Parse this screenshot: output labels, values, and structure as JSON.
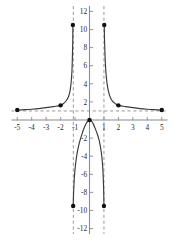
{
  "chart_data": {
    "type": "line",
    "title": "",
    "subtitle": "",
    "xlabel": "",
    "ylabel": "",
    "xlim": [
      -5.4,
      5.4
    ],
    "ylim": [
      -12.6,
      12.6
    ],
    "grid": false,
    "legend": "none",
    "x_ticks": [
      -5,
      -4,
      -3,
      -2,
      -1,
      1,
      2,
      3,
      4,
      5
    ],
    "x_tick_labels": [
      "-5",
      "-4",
      "-3",
      "-2",
      "-1",
      "1",
      "2",
      "3",
      "4",
      "5"
    ],
    "y_ticks": [
      12,
      10,
      8,
      6,
      4,
      2,
      -2,
      -4,
      -6,
      -8,
      -10,
      -12
    ],
    "y_tick_labels": [
      "12",
      "10",
      "8",
      "6",
      "4",
      "2",
      "-2",
      "-4",
      "-6",
      "-8",
      "-10",
      "-12"
    ],
    "asymptotes": {
      "horizontal": [
        1
      ],
      "vertical": [
        -1.12,
        1.0
      ]
    },
    "series": [
      {
        "name": "left-branch",
        "points": [
          [
            -5.0,
            1.1
          ],
          [
            -4.5,
            1.14
          ],
          [
            -4.0,
            1.19
          ],
          [
            -3.5,
            1.26
          ],
          [
            -3.0,
            1.36
          ],
          [
            -2.5,
            1.48
          ],
          [
            -2.0,
            1.62
          ],
          [
            -1.8,
            1.82
          ],
          [
            -1.6,
            2.15
          ],
          [
            -1.45,
            2.6
          ],
          [
            -1.35,
            3.2
          ],
          [
            -1.28,
            4.0
          ],
          [
            -1.23,
            5.0
          ],
          [
            -1.2,
            6.0
          ],
          [
            -1.18,
            7.2
          ],
          [
            -1.16,
            8.6
          ],
          [
            -1.15,
            10.5
          ]
        ]
      },
      {
        "name": "right-branch",
        "points": [
          [
            5.0,
            1.1
          ],
          [
            4.5,
            1.14
          ],
          [
            4.0,
            1.19
          ],
          [
            3.5,
            1.26
          ],
          [
            3.0,
            1.36
          ],
          [
            2.5,
            1.48
          ],
          [
            2.0,
            1.62
          ],
          [
            1.8,
            1.8
          ],
          [
            1.6,
            2.05
          ],
          [
            1.45,
            2.45
          ],
          [
            1.32,
            3.1
          ],
          [
            1.22,
            4.0
          ],
          [
            1.15,
            5.0
          ],
          [
            1.1,
            6.2
          ],
          [
            1.07,
            7.4
          ],
          [
            1.04,
            8.8
          ],
          [
            1.02,
            10.5
          ]
        ]
      },
      {
        "name": "middle-branch",
        "points": [
          [
            -1.13,
            -9.5
          ],
          [
            -1.1,
            -8.0
          ],
          [
            -1.05,
            -6.4
          ],
          [
            -0.98,
            -5.1
          ],
          [
            -0.9,
            -4.1
          ],
          [
            -0.8,
            -3.2
          ],
          [
            -0.68,
            -2.4
          ],
          [
            -0.55,
            -1.7
          ],
          [
            -0.4,
            -1.0
          ],
          [
            -0.25,
            -0.45
          ],
          [
            -0.12,
            -0.12
          ],
          [
            0.0,
            0.0
          ],
          [
            0.12,
            -0.1
          ],
          [
            0.25,
            -0.4
          ],
          [
            0.4,
            -0.95
          ],
          [
            0.55,
            -1.6
          ],
          [
            0.66,
            -2.2
          ],
          [
            0.76,
            -3.0
          ],
          [
            0.85,
            -4.0
          ],
          [
            0.91,
            -5.1
          ],
          [
            0.95,
            -6.3
          ],
          [
            0.98,
            -7.7
          ],
          [
            1.0,
            -9.5
          ]
        ]
      }
    ],
    "data_points": [
      {
        "label": "left-end",
        "x": -5.0,
        "y": 1.1
      },
      {
        "label": "left-mid",
        "x": -2.0,
        "y": 1.62
      },
      {
        "label": "left-top",
        "x": -1.15,
        "y": 10.5
      },
      {
        "label": "right-top",
        "x": 1.02,
        "y": 10.5
      },
      {
        "label": "right-mid",
        "x": 2.0,
        "y": 1.62
      },
      {
        "label": "right-end",
        "x": 5.0,
        "y": 1.1
      },
      {
        "label": "vertex",
        "x": 0.0,
        "y": 0.0
      },
      {
        "label": "middle-left-bottom",
        "x": -1.13,
        "y": -9.5
      },
      {
        "label": "middle-right-bottom",
        "x": 1.0,
        "y": -9.5
      }
    ],
    "colors": {
      "curve": "#3a3a3a",
      "axis": "#8a8a8a",
      "asymptote": "#9a9a9a",
      "point": "#111111",
      "background": "#ffffff",
      "text": "#2b2b2b"
    }
  }
}
